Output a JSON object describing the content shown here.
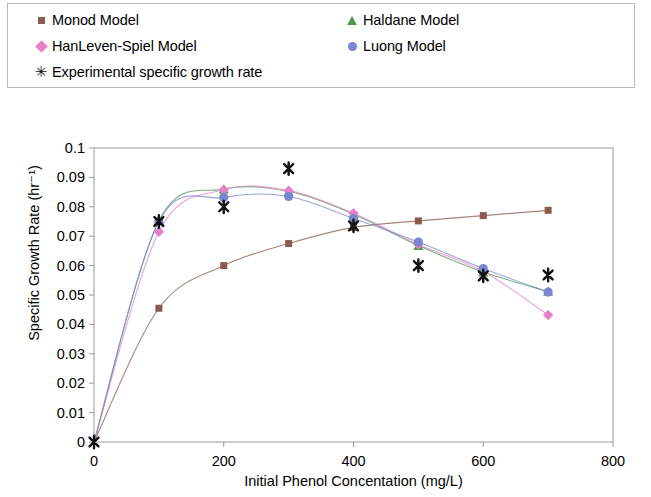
{
  "legend": {
    "entries": [
      {
        "label": "Monod Model",
        "marker": "square-marker",
        "color": "#8A5B50"
      },
      {
        "label": "Haldane Model",
        "marker": "triangle-marker",
        "color": "#4C9A52"
      },
      {
        "label": "HanLeven-Spiel Model",
        "marker": "diamond-marker",
        "color": "#E87FC9"
      },
      {
        "label": "Luong Model",
        "marker": "circle-marker",
        "color": "#7A86CE"
      },
      {
        "label": "Experimental specific growth rate",
        "marker": "x-marker",
        "color": "#111111"
      }
    ],
    "x_glyph": "✳"
  },
  "chart_data": {
    "type": "line",
    "title": "",
    "xlabel": "Initial Phenol Concentation (mg/L)",
    "ylabel": "Specific Growth Rate (hr⁻¹)",
    "xlim": [
      0,
      800
    ],
    "ylim": [
      0,
      0.1
    ],
    "xticks": [
      0,
      200,
      400,
      600,
      800
    ],
    "xtick_labels": [
      "0",
      "200",
      "400",
      "600",
      "800"
    ],
    "yticks": [
      0,
      0.01,
      0.02,
      0.03,
      0.04,
      0.05,
      0.06,
      0.07,
      0.08,
      0.09,
      0.1
    ],
    "ytick_labels": [
      "0",
      "0.01",
      "0.02",
      "0.03",
      "0.04",
      "0.05",
      "0.06",
      "0.07",
      "0.08",
      "0.09",
      "0.1"
    ],
    "grid": false,
    "legend_position": "top",
    "series": [
      {
        "name": "Monod Model",
        "marker": "square",
        "color": "#8A5B50",
        "x": [
          0,
          100,
          200,
          300,
          400,
          500,
          600,
          700
        ],
        "values": [
          0,
          0.0455,
          0.06,
          0.0675,
          0.073,
          0.0752,
          0.077,
          0.0788
        ]
      },
      {
        "name": "Haldane Model",
        "marker": "triangle",
        "color": "#4C9A52",
        "x": [
          0,
          100,
          200,
          300,
          400,
          500,
          600,
          700
        ],
        "values": [
          0,
          0.0752,
          0.086,
          0.0852,
          0.0775,
          0.0668,
          0.0578,
          0.0512
        ]
      },
      {
        "name": "HanLeven-Spiel Model",
        "marker": "diamond",
        "color": "#E87FC9",
        "x": [
          0,
          100,
          200,
          300,
          400,
          500,
          600,
          700
        ],
        "values": [
          0,
          0.0715,
          0.0858,
          0.0855,
          0.0778,
          0.0672,
          0.058,
          0.0432
        ]
      },
      {
        "name": "Luong Model",
        "marker": "circle",
        "color": "#7A86CE",
        "x": [
          0,
          100,
          200,
          300,
          400,
          500,
          600,
          700
        ],
        "values": [
          0,
          0.075,
          0.0832,
          0.0835,
          0.076,
          0.068,
          0.059,
          0.051
        ]
      },
      {
        "name": "Experimental specific growth rate",
        "marker": "x",
        "color": "#111111",
        "line": false,
        "x": [
          0,
          100,
          200,
          300,
          400,
          500,
          600,
          700
        ],
        "values": [
          0,
          0.075,
          0.08,
          0.093,
          0.0735,
          0.06,
          0.0565,
          0.0568
        ]
      }
    ]
  }
}
